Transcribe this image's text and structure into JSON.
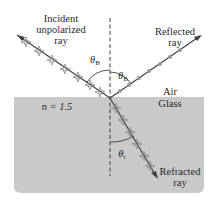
{
  "diagram": {
    "labels": {
      "incident_line1": "Incident",
      "incident_line2": "unpolarized",
      "incident_line3": "ray",
      "reflected_line1": "Reflected",
      "reflected_line2": "ray",
      "refracted_line1": "Refracted",
      "refracted_line2": "ray",
      "air": "Air",
      "glass": "Glass",
      "index": "n = 1.5",
      "theta_b_incident": "θ",
      "theta_b_incident_sub": "B",
      "theta_b_reflected": "θ",
      "theta_b_reflected_sub": "B",
      "theta_r": "θ",
      "theta_r_sub": "r"
    },
    "colors": {
      "glass_fill": "#c9c9c9",
      "ray_line": "#404040",
      "arrow_marks": "#8a8a8a",
      "dot_marks": "#9a9a9a",
      "normal_line": "#404040",
      "text": "#2a2a2a"
    }
  }
}
